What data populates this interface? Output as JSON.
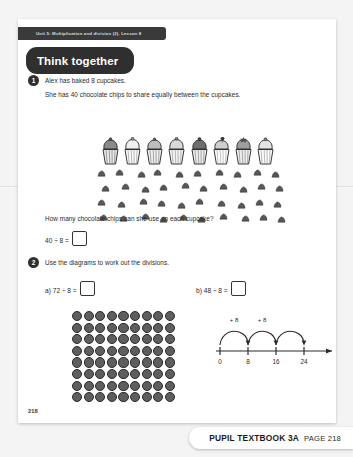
{
  "header": {
    "unit_strip": "Unit 5: Multiplication and division (2), Lesson 8",
    "section_title": "Think together"
  },
  "questions": [
    {
      "number": "1",
      "line1": "Alex has baked 8 cupcakes.",
      "line2": "She has 40 chocolate chips to share equally between the cupcakes.",
      "prompt": "How many chocolate chips can she use on each cupcake?",
      "equation": "40 ÷ 8 =",
      "answer": "",
      "cupcake_count": 8,
      "chip_count": 40
    },
    {
      "number": "2",
      "instruction": "Use the diagrams to work out the divisions.",
      "parts": [
        {
          "label": "a)",
          "equation": "72 ÷ 8 =",
          "answer": ""
        },
        {
          "label": "b)",
          "equation": "48 ÷ 8 =",
          "answer": ""
        }
      ]
    }
  ],
  "diagrams": {
    "dot_array": {
      "rows": 8,
      "cols": 9,
      "total": 72
    },
    "number_line": {
      "ticks": [
        "0",
        "8",
        "16",
        "24"
      ],
      "jump_labels": [
        "+ 8",
        "+ 8"
      ],
      "jump_count": 3,
      "step": 8
    }
  },
  "footer": {
    "page_number": "218",
    "book_label": "PUPIL TEXTBOOK 3A",
    "page_label": "PAGE 218"
  },
  "colors": {
    "pill_dark": "#2f2f2f",
    "strip_dark": "#3a3a3a",
    "dot_fill": "#5e5e5e",
    "ink": "#2a2a2a"
  }
}
